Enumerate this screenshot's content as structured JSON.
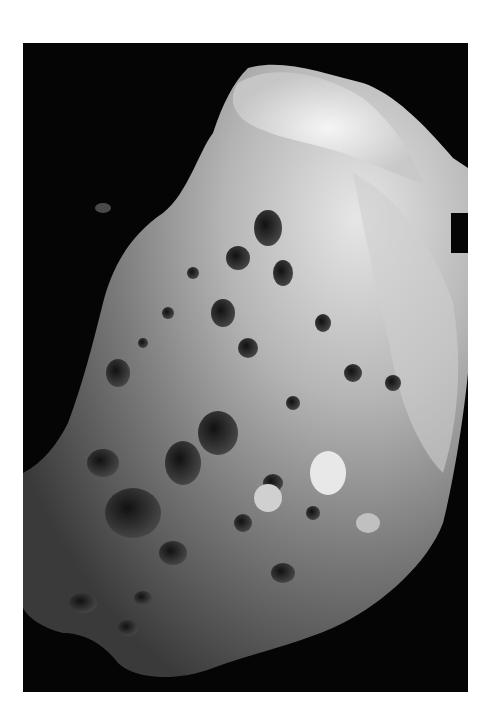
{
  "image": {
    "subject": "cratered moon surface photograph",
    "background_color": "#ffffff",
    "frame_color": "#050505",
    "surface_light": "#d8d8d8",
    "surface_mid": "#8a8a8a",
    "surface_dark": "#3a3a3a"
  }
}
